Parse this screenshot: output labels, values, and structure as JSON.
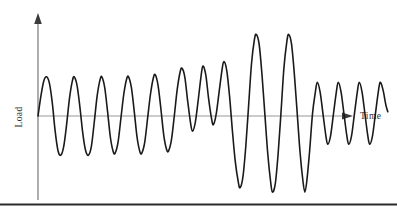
{
  "figure": {
    "name": "load-vs-time-waveform",
    "background_color": "#ffffff",
    "axes": {
      "y_axis_label": "Load",
      "x_axis_label": "Time",
      "axis_color": "#808080",
      "origin_x": 38,
      "origin_y": 116,
      "y_axis_top": 14,
      "x_axis_right": 352
    },
    "curve": {
      "color": "#1a1a1a",
      "stroke_width": 1.6
    },
    "bottom_rule": {
      "color": "#2b2b2b",
      "y": 204,
      "thickness": 2.2
    }
  },
  "chart_data": {
    "type": "line",
    "title": "",
    "xlabel": "Time",
    "ylabel": "Load",
    "grid": false,
    "legend": null,
    "axis_arrows": [
      "x-right",
      "y-up"
    ],
    "tick_labels": {
      "x": [],
      "y": []
    },
    "baseline": 0,
    "xlim": [
      0,
      320
    ],
    "ylim": [
      -80,
      80
    ],
    "series": [
      {
        "name": "Load history",
        "color": "#1a1a1a",
        "segments": [
          {
            "label": "block-1-moderate-low-frequency",
            "cycles": 3,
            "amplitude": 36,
            "half_period": 11.2,
            "x_start": 0,
            "x_end": 67
          },
          {
            "label": "block-2-rising-amplitude",
            "cycles": 5,
            "amplitude": 40,
            "half_period": 8.5,
            "x_start": 67,
            "x_end": 152
          },
          {
            "label": "block-3-small-dip",
            "cycles": 1,
            "amplitude": 18,
            "half_period": 6.0,
            "x_start": 152,
            "x_end": 164
          },
          {
            "label": "block-4-large-amplitude-overload",
            "cycles": 3,
            "amplitude": 75,
            "half_period": 11.0,
            "x_start": 164,
            "x_end": 230
          },
          {
            "label": "block-5-low-amplitude-high-frequency",
            "cycles": 5,
            "amplitude": 32,
            "half_period": 7.5,
            "x_start": 230,
            "x_end": 305
          }
        ],
        "points": [
          [
            0,
            0
          ],
          [
            3,
            18
          ],
          [
            6,
            32
          ],
          [
            9,
            36
          ],
          [
            12,
            30
          ],
          [
            15,
            12
          ],
          [
            18,
            -14
          ],
          [
            21,
            -32
          ],
          [
            24,
            -36
          ],
          [
            27,
            -28
          ],
          [
            30,
            -8
          ],
          [
            33,
            16
          ],
          [
            36,
            32
          ],
          [
            38,
            36
          ],
          [
            41,
            28
          ],
          [
            44,
            8
          ],
          [
            47,
            -16
          ],
          [
            50,
            -32
          ],
          [
            53,
            -36
          ],
          [
            56,
            -28
          ],
          [
            59,
            -6
          ],
          [
            62,
            18
          ],
          [
            65,
            33
          ],
          [
            67,
            36
          ],
          [
            70,
            26
          ],
          [
            73,
            4
          ],
          [
            76,
            -20
          ],
          [
            79,
            -33
          ],
          [
            81,
            -34
          ],
          [
            84,
            -24
          ],
          [
            87,
            -2
          ],
          [
            90,
            20
          ],
          [
            93,
            34
          ],
          [
            95,
            36
          ],
          [
            98,
            26
          ],
          [
            101,
            4
          ],
          [
            104,
            -20
          ],
          [
            107,
            -33
          ],
          [
            109,
            -34
          ],
          [
            112,
            -24
          ],
          [
            115,
            -2
          ],
          [
            118,
            20
          ],
          [
            121,
            35
          ],
          [
            123,
            38
          ],
          [
            126,
            28
          ],
          [
            129,
            6
          ],
          [
            132,
            -18
          ],
          [
            135,
            -31
          ],
          [
            137,
            -32
          ],
          [
            140,
            -22
          ],
          [
            143,
            0
          ],
          [
            146,
            24
          ],
          [
            149,
            40
          ],
          [
            151,
            44
          ],
          [
            154,
            36
          ],
          [
            157,
            14
          ],
          [
            160,
            -6
          ],
          [
            162,
            -14
          ],
          [
            165,
            -6
          ],
          [
            168,
            14
          ],
          [
            171,
            36
          ],
          [
            173,
            46
          ],
          [
            176,
            38
          ],
          [
            179,
            16
          ],
          [
            182,
            -2
          ],
          [
            184,
            -8
          ],
          [
            187,
            2
          ],
          [
            190,
            22
          ],
          [
            193,
            42
          ],
          [
            195,
            50
          ],
          [
            198,
            42
          ],
          [
            201,
            18
          ],
          [
            204,
            -14
          ],
          [
            207,
            -42
          ],
          [
            210,
            -60
          ],
          [
            212,
            -66
          ],
          [
            215,
            -56
          ],
          [
            218,
            -28
          ],
          [
            221,
            10
          ],
          [
            224,
            48
          ],
          [
            227,
            70
          ],
          [
            229,
            75
          ],
          [
            232,
            66
          ],
          [
            235,
            38
          ],
          [
            238,
            2
          ],
          [
            241,
            -34
          ],
          [
            244,
            -60
          ],
          [
            246,
            -70
          ],
          [
            249,
            -62
          ],
          [
            252,
            -34
          ],
          [
            255,
            4
          ],
          [
            258,
            44
          ],
          [
            261,
            68
          ],
          [
            263,
            75
          ],
          [
            266,
            66
          ],
          [
            269,
            38
          ],
          [
            272,
            2
          ],
          [
            275,
            -34
          ],
          [
            278,
            -60
          ],
          [
            280,
            -70
          ],
          [
            282,
            -60
          ],
          [
            285,
            -32
          ],
          [
            288,
            2
          ],
          [
            291,
            22
          ],
          [
            293,
            31
          ],
          [
            296,
            22
          ],
          [
            299,
            2
          ],
          [
            302,
            -18
          ],
          [
            304,
            -26
          ],
          [
            307,
            -18
          ],
          [
            310,
            2
          ],
          [
            313,
            22
          ],
          [
            315,
            31
          ],
          [
            318,
            22
          ],
          [
            321,
            2
          ],
          [
            324,
            -18
          ],
          [
            326,
            -26
          ],
          [
            329,
            -18
          ],
          [
            332,
            2
          ],
          [
            335,
            22
          ],
          [
            337,
            31
          ],
          [
            340,
            22
          ],
          [
            343,
            2
          ],
          [
            346,
            -18
          ],
          [
            348,
            -26
          ],
          [
            351,
            -18
          ],
          [
            354,
            2
          ],
          [
            357,
            22
          ],
          [
            359,
            31
          ],
          [
            362,
            24
          ],
          [
            365,
            10
          ],
          [
            367,
            4
          ]
        ]
      }
    ]
  }
}
